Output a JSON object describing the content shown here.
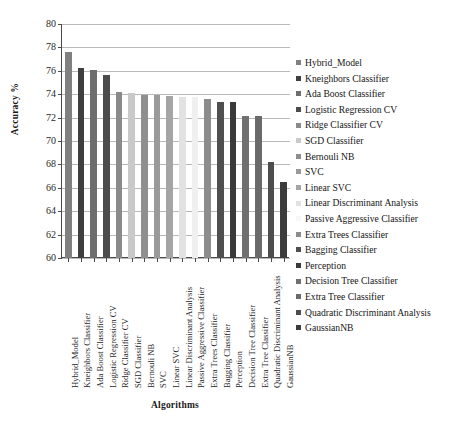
{
  "chart_data": {
    "type": "bar",
    "title": "",
    "xlabel": "Algorithms",
    "ylabel": "Accuracy %",
    "ylim": [
      60,
      80
    ],
    "ytick_step": 2,
    "yticks": [
      80,
      78,
      76,
      74,
      72,
      70,
      68,
      66,
      64,
      62,
      60
    ],
    "grid": true,
    "legend_position": "right",
    "categories": [
      "Hybrid_Model",
      "Kneighbors Classifier",
      "Ada Boost Classifier",
      "Logistic Regression CV",
      "Ridge Classifier CV",
      "SGD Classifier",
      "Bernouli NB",
      "SVC",
      "Linear SVC",
      "Linear Discriminant Analysis",
      "Passive Aggressive Classifier",
      "Extra Trees Classifier",
      "Bagging Classifier",
      "Perception",
      "Decision Tree Classifier",
      "Extra Tree Classifier",
      "Quadratic Discriminant Analysis",
      "GaussianNB"
    ],
    "values": [
      77.6,
      76.25,
      76.1,
      75.6,
      74.2,
      74.1,
      73.9,
      73.9,
      73.85,
      73.8,
      73.8,
      73.55,
      73.35,
      73.35,
      72.1,
      72.1,
      68.2,
      66.5
    ],
    "colors": [
      "#808080",
      "#3f3f3f",
      "#6e6e6e",
      "#4c4c4c",
      "#8a8a8a",
      "#c9c9c9",
      "#8f8f8f",
      "#9a9a9a",
      "#a5a5a5",
      "#e2e2e2",
      "#f0f0f0",
      "#8c8c8c",
      "#4f4f4f",
      "#3a3a3a",
      "#707070",
      "#6a6a6a",
      "#4d4d4d",
      "#3c3c3c"
    ]
  },
  "legend": {
    "items": [
      {
        "label": "Hybrid_Model",
        "color": "#808080"
      },
      {
        "label": "Kneighbors Classifier",
        "color": "#3f3f3f"
      },
      {
        "label": "Ada Boost Classifier",
        "color": "#6e6e6e"
      },
      {
        "label": "Logistic Regression CV",
        "color": "#4c4c4c"
      },
      {
        "label": "Ridge Classifier CV",
        "color": "#8a8a8a"
      },
      {
        "label": "SGD Classifier",
        "color": "#c9c9c9"
      },
      {
        "label": "Bernouli NB",
        "color": "#8f8f8f"
      },
      {
        "label": "SVC",
        "color": "#9a9a9a"
      },
      {
        "label": "Linear SVC",
        "color": "#a5a5a5"
      },
      {
        "label": "Linear Discriminant Analysis",
        "color": "#e2e2e2"
      },
      {
        "label": "Passive Aggressive Classifier",
        "color": "#f7f7f7"
      },
      {
        "label": "Extra Trees Classifier",
        "color": "#8c8c8c"
      },
      {
        "label": "Bagging Classifier",
        "color": "#4f4f4f"
      },
      {
        "label": "Perception",
        "color": "#3a3a3a"
      },
      {
        "label": "Decision Tree Classifier",
        "color": "#707070"
      },
      {
        "label": "Extra Tree Classifier",
        "color": "#6a6a6a"
      },
      {
        "label": "Quadratic Discriminant Analysis",
        "color": "#4d4d4d"
      },
      {
        "label": "GaussianNB",
        "color": "#3c3c3c"
      }
    ]
  }
}
